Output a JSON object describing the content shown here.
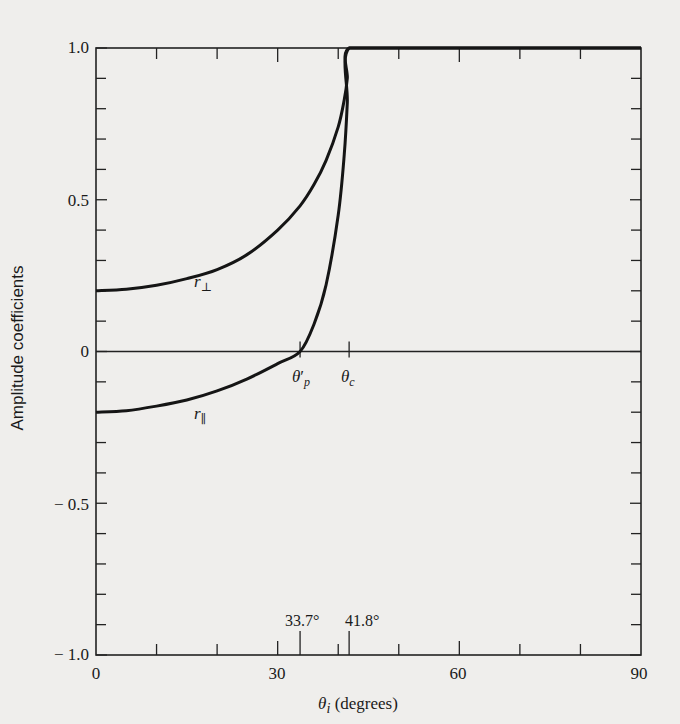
{
  "chart_data": {
    "type": "line",
    "title": "",
    "xlabel": "θ_i (degrees)",
    "ylabel": "Amplitude coefficients",
    "xlim": [
      0,
      90
    ],
    "ylim": [
      -1.0,
      1.0
    ],
    "grid": false,
    "legend": "none (curves labeled inline)",
    "x_ticks_labeled": [
      0,
      30,
      60,
      90
    ],
    "x_ticks_minor": [
      10,
      20,
      40,
      50,
      70,
      80
    ],
    "y_ticks_labeled": [
      -1.0,
      -0.5,
      0,
      0.5,
      1.0
    ],
    "y_ticks_minor_step": 0.1,
    "series": [
      {
        "name": "r_perp",
        "label": "r⊥",
        "x": [
          0,
          5,
          10,
          15,
          20,
          25,
          30,
          33.7,
          36,
          38,
          40,
          41,
          41.5,
          41.8,
          50,
          60,
          70,
          80,
          90
        ],
        "values": [
          0.2,
          0.205,
          0.218,
          0.24,
          0.27,
          0.32,
          0.4,
          0.48,
          0.55,
          0.63,
          0.74,
          0.83,
          0.9,
          1.0,
          1.0,
          1.0,
          1.0,
          1.0,
          1.0
        ]
      },
      {
        "name": "r_parallel",
        "label": "r∥",
        "x": [
          0,
          5,
          10,
          15,
          20,
          25,
          30,
          33.7,
          36,
          38,
          40,
          41,
          41.5,
          41.8,
          50,
          60,
          70,
          80,
          90
        ],
        "values": [
          -0.2,
          -0.195,
          -0.18,
          -0.16,
          -0.13,
          -0.09,
          -0.04,
          0.0,
          0.09,
          0.22,
          0.45,
          0.65,
          0.82,
          1.0,
          1.0,
          1.0,
          1.0,
          1.0,
          1.0
        ]
      }
    ],
    "annotations": [
      {
        "text": "θ'p",
        "x": 33.7,
        "y": 0,
        "meaning": "polarization angle"
      },
      {
        "text": "θc",
        "x": 41.8,
        "y": 0,
        "meaning": "critical angle"
      },
      {
        "text": "33.7°",
        "x": 33.7,
        "y": -1.0
      },
      {
        "text": "41.8°",
        "x": 41.8,
        "y": -1.0
      }
    ]
  },
  "labels": {
    "ylabel": "Amplitude coefficients",
    "xlabel_symbol": "θ",
    "xlabel_sub": "i",
    "xlabel_unit": " (degrees)",
    "y_ticks": [
      "1.0",
      "0.5",
      "0",
      "− 0.5",
      "− 1.0"
    ],
    "x_ticks": [
      "0",
      "30",
      "60",
      "90"
    ],
    "r_perp": "r",
    "r_perp_sub": "⊥",
    "r_par": "r",
    "r_par_sub": "∥",
    "theta_p": "θ",
    "theta_p_sub": "p",
    "theta_p_prime": "′",
    "theta_c": "θ",
    "theta_c_sub": "c",
    "angle_p_value": "33.7°",
    "angle_c_value": "41.8°"
  }
}
